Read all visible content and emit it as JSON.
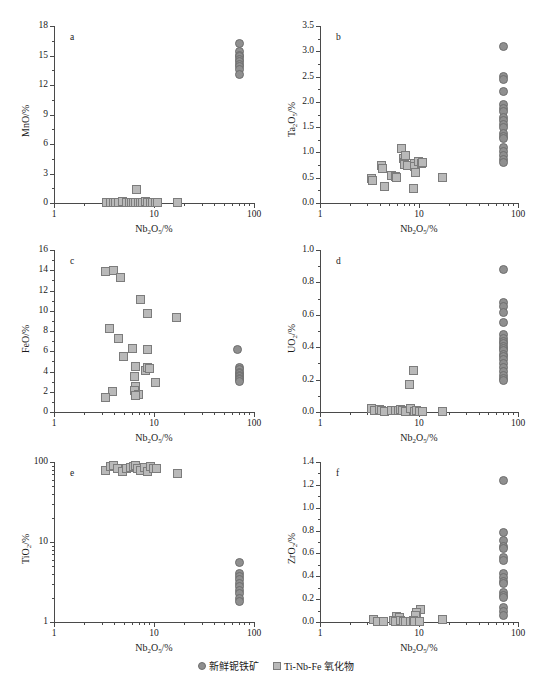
{
  "figure": {
    "width": 552,
    "height": 682,
    "marker_colors": {
      "circle_fill": "#8f8f8f",
      "circle_edge": "#6e6e6e",
      "square_fill": "#b9b9b9",
      "square_edge": "#7c7c7c"
    },
    "legend": {
      "items": [
        {
          "marker": "circle",
          "label": "新鲜铌铁矿"
        },
        {
          "marker": "square",
          "label": "Ti-Nb-Fe 氧化物"
        }
      ]
    }
  },
  "chart_data": [
    {
      "type": "scatter",
      "panel": "a",
      "title": "",
      "xlabel": "Nb2O5/%",
      "ylabel": "MnO/%",
      "xscale": "log",
      "yscale": "linear",
      "xlim": [
        1,
        100
      ],
      "ylim": [
        0,
        18
      ],
      "xticks": [
        1,
        10,
        100
      ],
      "xticklabels": [
        "1",
        "10",
        "100"
      ],
      "yticks": [
        0,
        3,
        6,
        9,
        12,
        15,
        18
      ],
      "yticklabels": [
        "0",
        "3",
        "6",
        "9",
        "12",
        "15",
        "18"
      ],
      "grid": false,
      "series": [
        {
          "name": "新鲜铌铁矿",
          "marker": "circle",
          "points": [
            [
              70,
              16.3
            ],
            [
              71,
              15.5
            ],
            [
              70,
              15.1
            ],
            [
              71.5,
              14.9
            ],
            [
              70,
              14.6
            ],
            [
              71,
              14.4
            ],
            [
              70.5,
              14.1
            ],
            [
              71.5,
              13.9
            ],
            [
              70,
              13.6
            ],
            [
              70.5,
              13.1
            ]
          ]
        },
        {
          "name": "Ti-Nb-Fe 氧化物",
          "marker": "square",
          "points": [
            [
              3.3,
              0.1
            ],
            [
              3.6,
              0.08
            ],
            [
              3.9,
              0.15
            ],
            [
              4.1,
              0.12
            ],
            [
              4.4,
              0.1
            ],
            [
              4.8,
              0.2
            ],
            [
              5.2,
              0.15
            ],
            [
              5.6,
              0.1
            ],
            [
              5.9,
              0.12
            ],
            [
              6.2,
              0.08
            ],
            [
              6.5,
              0.1
            ],
            [
              6.6,
              1.4
            ],
            [
              6.9,
              0.15
            ],
            [
              7.2,
              0.1
            ],
            [
              7.6,
              0.12
            ],
            [
              8.1,
              0.2
            ],
            [
              8.6,
              0.15
            ],
            [
              9.1,
              0.1
            ],
            [
              9.6,
              0.12
            ],
            [
              10.2,
              0.1
            ],
            [
              10.8,
              0.08
            ],
            [
              17,
              0.1
            ]
          ]
        }
      ]
    },
    {
      "type": "scatter",
      "panel": "b",
      "title": "",
      "xlabel": "Nb2O5/%",
      "ylabel": "Ta2O5/%",
      "xscale": "log",
      "yscale": "linear",
      "xlim": [
        1,
        100
      ],
      "ylim": [
        0.0,
        3.5
      ],
      "xticks": [
        1,
        10,
        100
      ],
      "xticklabels": [
        "1",
        "10",
        "100"
      ],
      "yticks": [
        0.0,
        0.5,
        1.0,
        1.5,
        2.0,
        2.5,
        3.0,
        3.5
      ],
      "yticklabels": [
        "0.0",
        "0.5",
        "1.0",
        "1.5",
        "2.0",
        "2.5",
        "3.0",
        "3.5"
      ],
      "grid": false,
      "series": [
        {
          "name": "新鲜铌铁矿",
          "marker": "circle",
          "points": [
            [
              70,
              3.11
            ],
            [
              70,
              2.52
            ],
            [
              70,
              2.45
            ],
            [
              70,
              2.21
            ],
            [
              70,
              1.95
            ],
            [
              70.5,
              1.87
            ],
            [
              70,
              1.81
            ],
            [
              71,
              1.7
            ],
            [
              70,
              1.64
            ],
            [
              70.5,
              1.57
            ],
            [
              70,
              1.5
            ],
            [
              70.5,
              1.38
            ],
            [
              70,
              1.32
            ],
            [
              70.5,
              1.28
            ],
            [
              70,
              1.1
            ],
            [
              70.5,
              1.02
            ],
            [
              70,
              0.95
            ],
            [
              70.5,
              0.87
            ],
            [
              70,
              0.81
            ]
          ]
        },
        {
          "name": "Ti-Nb-Fe 氧化物",
          "marker": "square",
          "points": [
            [
              3.3,
              0.5
            ],
            [
              3.35,
              0.45
            ],
            [
              4.1,
              0.75
            ],
            [
              4.2,
              0.7
            ],
            [
              4.4,
              0.34
            ],
            [
              5.2,
              0.56
            ],
            [
              5.7,
              0.53
            ],
            [
              5.9,
              0.52
            ],
            [
              6.6,
              1.08
            ],
            [
              6.9,
              0.88
            ],
            [
              7.0,
              0.82
            ],
            [
              7.1,
              0.78
            ],
            [
              7.3,
              0.94
            ],
            [
              7.5,
              0.75
            ],
            [
              8.6,
              0.3
            ],
            [
              8.8,
              0.79
            ],
            [
              9.0,
              0.73
            ],
            [
              9.2,
              0.62
            ],
            [
              9.8,
              0.83
            ],
            [
              10.4,
              0.8
            ],
            [
              10.8,
              0.82
            ],
            [
              17,
              0.52
            ]
          ]
        }
      ]
    },
    {
      "type": "scatter",
      "panel": "c",
      "title": "",
      "xlabel": "Nb2O5/%",
      "ylabel": "FeO/%",
      "xscale": "log",
      "yscale": "linear",
      "xlim": [
        1,
        100
      ],
      "ylim": [
        0,
        16
      ],
      "xticks": [
        1,
        10,
        100
      ],
      "xticklabels": [
        "1",
        "10",
        "100"
      ],
      "yticks": [
        0,
        2,
        4,
        6,
        8,
        10,
        12,
        14,
        16
      ],
      "yticklabels": [
        "0",
        "2",
        "4",
        "6",
        "8",
        "10",
        "12",
        "14",
        "16"
      ],
      "grid": false,
      "series": [
        {
          "name": "新鲜铌铁矿",
          "marker": "circle",
          "points": [
            [
              68,
              6.25
            ],
            [
              70,
              4.4
            ],
            [
              70.5,
              4.2
            ],
            [
              70,
              4.0
            ],
            [
              70.5,
              3.85
            ],
            [
              70,
              3.7
            ],
            [
              70.5,
              3.55
            ],
            [
              70,
              3.4
            ],
            [
              70.5,
              3.25
            ],
            [
              70,
              3.05
            ]
          ]
        },
        {
          "name": "Ti-Nb-Fe 氧化物",
          "marker": "square",
          "points": [
            [
              3.2,
              13.95
            ],
            [
              3.85,
              14.05
            ],
            [
              4.6,
              13.3
            ],
            [
              7.3,
              11.2
            ],
            [
              8.5,
              9.75
            ],
            [
              16.5,
              9.4
            ],
            [
              3.55,
              8.3
            ],
            [
              4.4,
              7.35
            ],
            [
              6.0,
              6.3
            ],
            [
              8.5,
              6.25
            ],
            [
              4.9,
              5.55
            ],
            [
              6.5,
              4.5
            ],
            [
              8.1,
              4.1
            ],
            [
              8.6,
              4.4
            ],
            [
              9.0,
              4.35
            ],
            [
              6.3,
              3.6
            ],
            [
              10.2,
              2.95
            ],
            [
              6.4,
              2.6
            ],
            [
              6.3,
              2.2
            ],
            [
              6.9,
              1.8
            ],
            [
              3.8,
              2.1
            ],
            [
              3.25,
              1.5
            ],
            [
              6.5,
              1.7
            ]
          ]
        }
      ]
    },
    {
      "type": "scatter",
      "panel": "d",
      "title": "",
      "xlabel": "Nb2O5/%",
      "ylabel": "UO2/%",
      "xscale": "log",
      "yscale": "linear",
      "xlim": [
        1,
        100
      ],
      "ylim": [
        0.0,
        1.0
      ],
      "xticks": [
        1,
        10,
        100
      ],
      "xticklabels": [
        "1",
        "10",
        "100"
      ],
      "yticks": [
        0.0,
        0.2,
        0.4,
        0.6,
        0.8,
        1.0
      ],
      "yticklabels": [
        "0.0",
        "0.2",
        "0.4",
        "0.6",
        "0.8",
        "1.0"
      ],
      "grid": false,
      "series": [
        {
          "name": "新鲜铌铁矿",
          "marker": "circle",
          "points": [
            [
              70,
              0.88
            ],
            [
              70,
              0.68
            ],
            [
              70,
              0.655
            ],
            [
              70,
              0.62
            ],
            [
              70,
              0.555
            ],
            [
              70.5,
              0.48
            ],
            [
              70,
              0.455
            ],
            [
              70.5,
              0.44
            ],
            [
              70,
              0.425
            ],
            [
              70.5,
              0.41
            ],
            [
              70,
              0.395
            ],
            [
              70.5,
              0.38
            ],
            [
              70,
              0.36
            ],
            [
              70.5,
              0.345
            ],
            [
              70,
              0.325
            ],
            [
              70.5,
              0.3
            ],
            [
              70,
              0.275
            ],
            [
              70.5,
              0.255
            ],
            [
              70,
              0.23
            ],
            [
              70.5,
              0.21
            ],
            [
              70,
              0.195
            ]
          ]
        },
        {
          "name": "Ti-Nb-Fe 氧化物",
          "marker": "square",
          "points": [
            [
              8.6,
              0.26
            ],
            [
              8.0,
              0.17
            ],
            [
              3.3,
              0.025
            ],
            [
              3.5,
              0.01
            ],
            [
              3.9,
              0.02
            ],
            [
              4.1,
              0.015
            ],
            [
              4.4,
              0.005
            ],
            [
              5.2,
              0.01
            ],
            [
              5.7,
              0.015
            ],
            [
              6.1,
              0.01
            ],
            [
              6.5,
              0.02
            ],
            [
              6.8,
              0.01
            ],
            [
              7.2,
              0.005
            ],
            [
              8.2,
              0.025
            ],
            [
              8.9,
              0.005
            ],
            [
              9.4,
              0.01
            ],
            [
              10.0,
              0.005
            ],
            [
              10.6,
              0.008
            ],
            [
              17,
              0.005
            ]
          ]
        }
      ]
    },
    {
      "type": "scatter",
      "panel": "e",
      "title": "",
      "xlabel": "Nb2O5/%",
      "ylabel": "TiO2/%",
      "xscale": "log",
      "yscale": "log",
      "xlim": [
        1,
        100
      ],
      "ylim": [
        1,
        100
      ],
      "xticks": [
        1,
        10,
        100
      ],
      "xticklabels": [
        "1",
        "10",
        "100"
      ],
      "yticks": [
        1,
        10,
        100
      ],
      "yticklabels": [
        "1",
        "10",
        "100"
      ],
      "grid": false,
      "series": [
        {
          "name": "新鲜铌铁矿",
          "marker": "circle",
          "points": [
            [
              70,
              5.6
            ],
            [
              70.5,
              4.1
            ],
            [
              70,
              3.8
            ],
            [
              70.5,
              3.4
            ],
            [
              70,
              3.1
            ],
            [
              70.5,
              2.8
            ],
            [
              70,
              2.5
            ],
            [
              70.5,
              2.3
            ],
            [
              70,
              2.0
            ],
            [
              70.5,
              1.85
            ]
          ]
        },
        {
          "name": "Ti-Nb-Fe 氧化物",
          "marker": "square",
          "points": [
            [
              3.2,
              80
            ],
            [
              3.6,
              88
            ],
            [
              3.9,
              92
            ],
            [
              4.3,
              85
            ],
            [
              4.8,
              78
            ],
            [
              5.3,
              84
            ],
            [
              5.8,
              86
            ],
            [
              6.2,
              88
            ],
            [
              6.5,
              92
            ],
            [
              6.8,
              85
            ],
            [
              7.3,
              80
            ],
            [
              8.0,
              86
            ],
            [
              8.6,
              78
            ],
            [
              9.2,
              88
            ],
            [
              9.8,
              85
            ],
            [
              10.4,
              83
            ],
            [
              17,
              72
            ]
          ]
        }
      ]
    },
    {
      "type": "scatter",
      "panel": "f",
      "title": "",
      "xlabel": "Nb2O5/%",
      "ylabel": "ZrO2/%",
      "xscale": "log",
      "yscale": "linear",
      "xlim": [
        1,
        100
      ],
      "ylim": [
        0.0,
        1.4
      ],
      "xticks": [
        1,
        10,
        100
      ],
      "xticklabels": [
        "1",
        "10",
        "100"
      ],
      "yticks": [
        0.0,
        0.2,
        0.4,
        0.6,
        0.8,
        1.0,
        1.2,
        1.4
      ],
      "yticklabels": [
        "0.0",
        "0.2",
        "0.4",
        "0.6",
        "0.8",
        "1.0",
        "1.2",
        "1.4"
      ],
      "grid": false,
      "series": [
        {
          "name": "新鲜铌铁矿",
          "marker": "circle",
          "points": [
            [
              70,
              1.24
            ],
            [
              70,
              0.785
            ],
            [
              70,
              0.715
            ],
            [
              70,
              0.665
            ],
            [
              70,
              0.645
            ],
            [
              70,
              0.565
            ],
            [
              70,
              0.545
            ],
            [
              70,
              0.425
            ],
            [
              70,
              0.395
            ],
            [
              70,
              0.36
            ],
            [
              70,
              0.345
            ],
            [
              70,
              0.26
            ],
            [
              70,
              0.24
            ],
            [
              70,
              0.215
            ],
            [
              70,
              0.135
            ],
            [
              70,
              0.1
            ],
            [
              70,
              0.06
            ]
          ]
        },
        {
          "name": "Ti-Nb-Fe 氧化物",
          "marker": "square",
          "points": [
            [
              10.2,
              0.115
            ],
            [
              9.4,
              0.09
            ],
            [
              9.2,
              0.065
            ],
            [
              5.9,
              0.055
            ],
            [
              6.3,
              0.04
            ],
            [
              3.4,
              0.025
            ],
            [
              3.8,
              0.012
            ],
            [
              4.3,
              0.012
            ],
            [
              5.4,
              0.02
            ],
            [
              5.7,
              0.01
            ],
            [
              6.5,
              0.015
            ],
            [
              6.9,
              0.008
            ],
            [
              7.3,
              0.012
            ],
            [
              8.2,
              0.01
            ],
            [
              8.7,
              0.015
            ],
            [
              9.0,
              0.008
            ],
            [
              10.0,
              0.01
            ],
            [
              17,
              0.03
            ]
          ]
        }
      ]
    }
  ]
}
